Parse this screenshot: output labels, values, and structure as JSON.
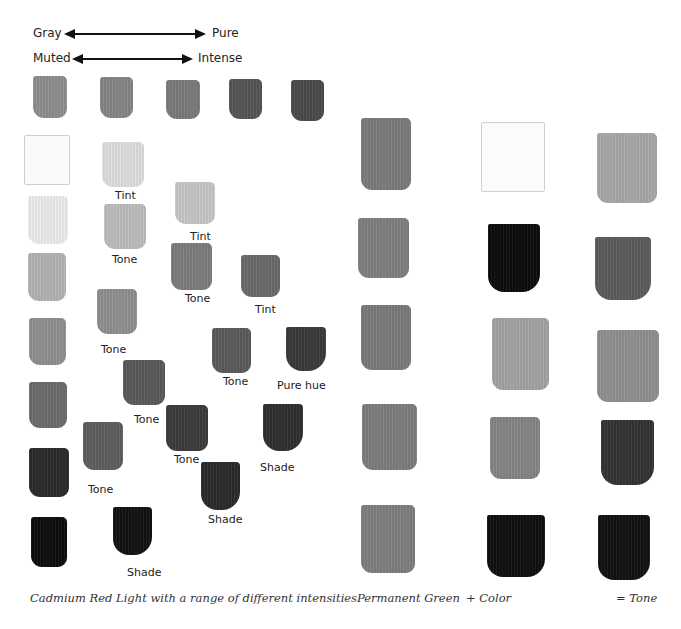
{
  "scale": {
    "row1": {
      "left": "Gray",
      "right": "Pure"
    },
    "row2": {
      "left": "Muted",
      "right": "Intense"
    }
  },
  "left_panel": {
    "subject": "Cadmium Red Light",
    "top_row": [
      {
        "color": "#8e8e8e"
      },
      {
        "color": "#858585"
      },
      {
        "color": "#7a7a7a"
      },
      {
        "color": "#555555"
      },
      {
        "color": "#4a4a4a"
      }
    ],
    "column1": [
      {
        "color": "#fafafa",
        "kind": "white"
      },
      {
        "color": "#ececec"
      },
      {
        "color": "#b3b3b3"
      },
      {
        "color": "#8f8f8f"
      },
      {
        "color": "#6b6b6b"
      },
      {
        "color": "#2a2a2a"
      },
      {
        "color": "#0d0d0d"
      }
    ],
    "swatches": [
      {
        "label": "Tint",
        "color": "#dedede"
      },
      {
        "label": "Tone",
        "color": "#bdbdbd"
      },
      {
        "label": "Tone",
        "color": "#8f8f8f"
      },
      {
        "label": "Tone",
        "color": "#5e5e5e"
      },
      {
        "label": "Shade",
        "color": "#121212"
      },
      {
        "label": "Tint",
        "color": "#c6c6c6"
      },
      {
        "label": "Tone",
        "color": "#7c7c7c"
      },
      {
        "label": "Tone",
        "color": "#5a5a5a"
      },
      {
        "label": "Tone",
        "color": "#3c3c3c"
      },
      {
        "label": "Shade",
        "color": "#2a2a2a"
      },
      {
        "label": "Tint",
        "color": "#6a6a6a"
      },
      {
        "label": "Tone",
        "color": "#5b5b5b"
      },
      {
        "label": "Shade",
        "color": "#2f2f2f"
      },
      {
        "label": "Pure hue",
        "color": "#3a3a3a"
      }
    ],
    "caption": "Cadmium Red Light with a range of different intensities."
  },
  "right_panel": {
    "columns": [
      {
        "caption": "Permanent Green",
        "colors": [
          "#7b7b7b",
          "#7f7f7f",
          "#7a7a7a",
          "#7d7d7d",
          "#7e7e7e"
        ]
      },
      {
        "caption": "+ Color",
        "colors": [
          "#fbfbfb",
          "#0c0c0c",
          "#a3a3a3",
          "#858585",
          "#0f0f0f"
        ]
      },
      {
        "caption": "= Tone",
        "colors": [
          "#a8a8a8",
          "#5c5c5c",
          "#8f8f8f",
          "#333333",
          "#121212"
        ]
      }
    ]
  }
}
